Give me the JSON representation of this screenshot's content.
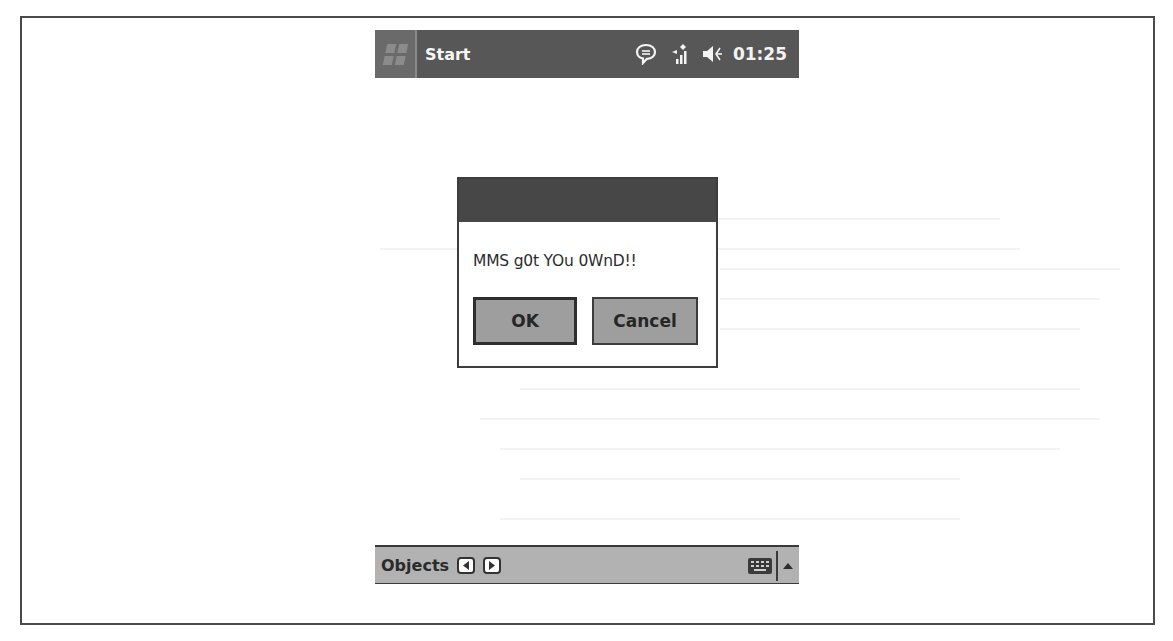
{
  "taskbar": {
    "start_label": "Start",
    "icons": [
      "windows-flag-icon",
      "message-bubble-icon",
      "signal-antenna-icon",
      "speaker-volume-icon"
    ],
    "clock": "01:25",
    "background": "#575757"
  },
  "dialog": {
    "title": "",
    "message": "MMS g0t YOu 0WnD!!",
    "buttons": {
      "ok_label": "OK",
      "cancel_label": "Cancel"
    },
    "titlebar_color": "#474747",
    "button_color": "#9e9e9e"
  },
  "menubar": {
    "label": "Objects",
    "prev_icon": "left-arrow-icon",
    "next_icon": "right-arrow-icon",
    "keyboard_icon": "keyboard-icon",
    "sip_icon": "up-triangle-icon",
    "background": "#b2b2b2"
  }
}
